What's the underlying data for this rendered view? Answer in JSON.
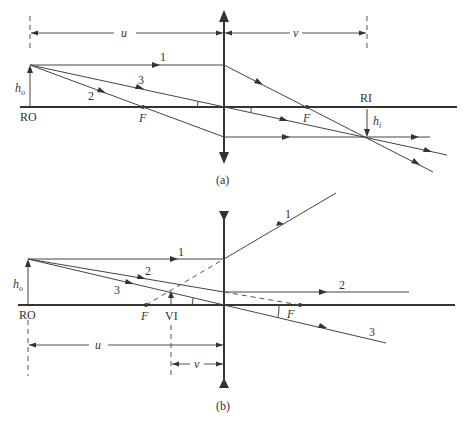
{
  "figure_a": {
    "caption": "(a)",
    "lens_type": "converging",
    "object_label": "RO",
    "image_label": "RI",
    "object_height_label": "h",
    "object_height_sub": "o",
    "image_height_label": "h",
    "image_height_sub": "i",
    "focal_left_label": "F",
    "focal_right_label": "F",
    "object_distance_label": "u",
    "image_distance_label": "v",
    "rays": [
      "1",
      "2",
      "3"
    ]
  },
  "figure_b": {
    "caption": "(b)",
    "lens_type": "diverging",
    "object_label": "RO",
    "image_label": "VI",
    "object_height_label": "h",
    "object_height_sub": "o",
    "focal_left_label": "F",
    "focal_right_label": "F",
    "object_distance_label": "u",
    "image_distance_label": "v",
    "rays": [
      "1",
      "2",
      "3"
    ],
    "ray_out_labels": [
      "1",
      "2",
      "3"
    ]
  },
  "colors": {
    "line": "#333333",
    "background": "#ffffff"
  }
}
